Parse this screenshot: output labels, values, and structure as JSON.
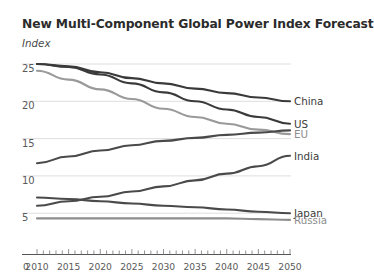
{
  "chart_data": {
    "type": "line",
    "title": "New Multi-Component Global Power Index Forecast",
    "subtitle": "Index",
    "xlabel": "",
    "ylabel": "Index",
    "xlim": [
      2010,
      2050
    ],
    "ylim": [
      0,
      26.5
    ],
    "yticks": [
      0,
      5,
      10,
      15,
      20,
      25
    ],
    "xticks": [
      2010,
      2015,
      2020,
      2025,
      2030,
      2035,
      2040,
      2045,
      2050
    ],
    "x_minor_tick_step": 1,
    "x_axis_origin_label": "0",
    "grid": "horizontal",
    "legend": "right-inline-labels",
    "x": [
      2010,
      2015,
      2020,
      2025,
      2030,
      2035,
      2040,
      2045,
      2050
    ],
    "series": [
      {
        "name": "China",
        "color": "#3a3a3a",
        "values": [
          25.0,
          24.7,
          23.9,
          23.1,
          22.4,
          21.7,
          21.1,
          20.5,
          20.0
        ]
      },
      {
        "name": "US",
        "color": "#3a3a3a",
        "values": [
          25.0,
          24.6,
          23.6,
          22.4,
          21.2,
          20.0,
          18.9,
          17.9,
          17.0
        ]
      },
      {
        "name": "EU",
        "color": "#9a9a9a",
        "values": [
          24.1,
          22.9,
          21.6,
          20.3,
          19.0,
          17.9,
          17.0,
          16.2,
          15.6
        ]
      },
      {
        "name": "India",
        "color": "#4a4a4a",
        "values": [
          11.7,
          12.6,
          13.4,
          14.1,
          14.7,
          15.1,
          15.5,
          15.8,
          16.1
        ]
      },
      {
        "name": "Japan",
        "color": "#4a4a4a",
        "values": [
          7.1,
          6.9,
          6.6,
          6.3,
          6.0,
          5.8,
          5.5,
          5.2,
          5.0
        ]
      },
      {
        "name": "Russia",
        "color": "#8d8d8d",
        "values": [
          4.3,
          4.3,
          4.3,
          4.3,
          4.3,
          4.3,
          4.3,
          4.2,
          4.1
        ]
      }
    ],
    "lower_band_series": [
      {
        "name": "India-lower",
        "color": "#4a4a4a",
        "values": [
          6.0,
          6.6,
          7.2,
          7.9,
          8.6,
          9.4,
          10.3,
          11.3,
          12.7
        ]
      }
    ],
    "series_end_labels": [
      {
        "name": "China",
        "muted": false,
        "y_value": 20.0
      },
      {
        "name": "US",
        "muted": false,
        "y_value": 17.0
      },
      {
        "name": "EU",
        "muted": true,
        "y_value": 15.6
      },
      {
        "name": "India",
        "muted": false,
        "y_value": 12.7
      },
      {
        "name": "Japan",
        "muted": false,
        "y_value": 5.0
      },
      {
        "name": "Russia",
        "muted": true,
        "y_value": 4.1
      }
    ]
  },
  "yticks": [
    {
      "label": "25"
    },
    {
      "label": "20"
    },
    {
      "label": "15"
    },
    {
      "label": "10"
    },
    {
      "label": "5"
    }
  ],
  "xticks": [
    {
      "label": "0"
    },
    {
      "label": "2010"
    },
    {
      "label": "2015"
    },
    {
      "label": "2020"
    },
    {
      "label": "2025"
    },
    {
      "label": "2030"
    },
    {
      "label": "2035"
    },
    {
      "label": "2040"
    },
    {
      "label": "2045"
    },
    {
      "label": "2050"
    }
  ],
  "labels": [
    {
      "text": "China"
    },
    {
      "text": "US"
    },
    {
      "text": "EU"
    },
    {
      "text": "India"
    },
    {
      "text": "Japan"
    },
    {
      "text": "Russia"
    }
  ]
}
